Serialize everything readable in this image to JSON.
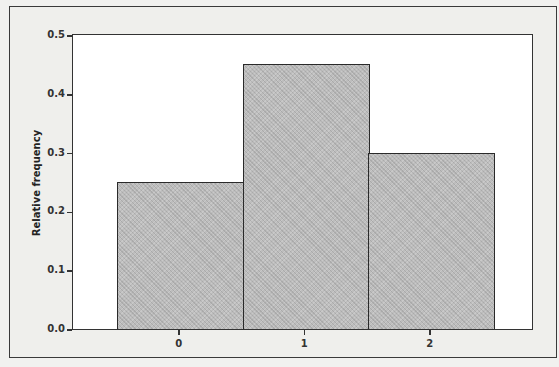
{
  "chart_data": {
    "type": "bar",
    "title": "",
    "xlabel": "",
    "ylabel": "Relative frequency",
    "categories": [
      "0",
      "1",
      "2"
    ],
    "values": [
      0.25,
      0.45,
      0.3
    ],
    "ylim": [
      0,
      0.5
    ],
    "yticks": [
      "0.0",
      "0.1",
      "0.2",
      "0.3",
      "0.4",
      "0.5"
    ],
    "xticks": [
      "0",
      "1",
      "2"
    ],
    "grid": false,
    "legend": null,
    "bar_style": "histogram (adjacent bars, no gaps)",
    "colors": {
      "bar_fill": "#bdbdbd",
      "bar_edge": "#2a2a2a",
      "plot_bg": "#ffffff",
      "frame_bg": "#efefec"
    }
  }
}
